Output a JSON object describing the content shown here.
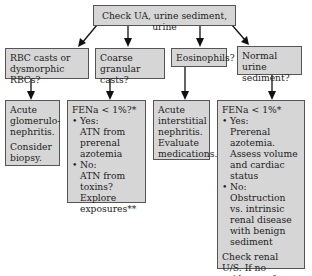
{
  "root": {
    "label": "Check UA, urine sediment, urine"
  },
  "branches": [
    {
      "question": "RBC casts or dysmorphic RBCs?",
      "result": {
        "lines": [
          "Acute glomerulo-nephritis."
        ],
        "note": "Consider biopsy."
      }
    },
    {
      "question": "Coarse granular casts?",
      "result": {
        "header": "FENa < 1%?*",
        "yes_label": "Yes:",
        "yes_text": "ATN from prerenal azotemia",
        "no_label": "No:",
        "no_text": "ATN from toxins? Explore exposures**"
      }
    },
    {
      "question": "Eosinophils?",
      "result": {
        "lines": [
          "Acute interstitial nephritis.",
          "Evaluate medications."
        ]
      }
    },
    {
      "question": "Normal urine sediment?",
      "result": {
        "header": "FENa < 1%*",
        "yes_label": "Yes:",
        "yes_text": "Prerenal azotemia. Assess volume and cardiac status",
        "no_label": "No:",
        "no_text": "Obstruction vs. intrinsic renal disease with benign sediment",
        "note": "Check renal U/S. If no evidence of obstruction, consider biopsy or other diagnostic studies."
      }
    }
  ],
  "bullet_glyph": "•",
  "colors": {
    "box_fill": "#d6d6d6",
    "border": "#555555",
    "arrow": "#111111"
  }
}
